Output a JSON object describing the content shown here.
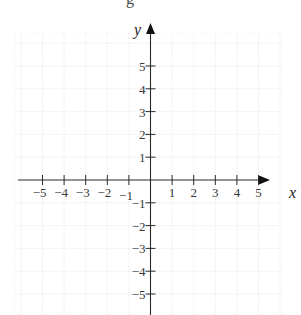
{
  "chart_data": {
    "type": "scatter",
    "title": "",
    "xlabel": "x",
    "ylabel": "y",
    "xlim": [
      -6,
      6
    ],
    "ylim": [
      -6,
      6
    ],
    "grid": true,
    "legend": null,
    "x_ticks": [
      -5,
      -4,
      -3,
      -2,
      -1,
      1,
      2,
      3,
      4,
      5
    ],
    "y_ticks": [
      -5,
      -4,
      -3,
      -2,
      -1,
      1,
      2,
      3,
      4,
      5
    ],
    "x_tick_labels": [
      "−5",
      "−4",
      "−3",
      "−2",
      "−1",
      "1",
      "2",
      "3",
      "4",
      "5"
    ],
    "y_tick_labels": [
      "−5",
      "−4",
      "−3",
      "−2",
      "−1",
      "1",
      "2",
      "3",
      "4",
      "5"
    ],
    "series": [],
    "annotations": [
      "cut-off glyph at top edge (partial 'g')"
    ]
  },
  "labels": {
    "x_axis": "x",
    "y_axis": "y",
    "top_cutoff": "g"
  },
  "colors": {
    "axis": "#2a2a2a",
    "grid": "#e4e4e4",
    "text": "#3a3a3a",
    "background": "#ffffff"
  }
}
